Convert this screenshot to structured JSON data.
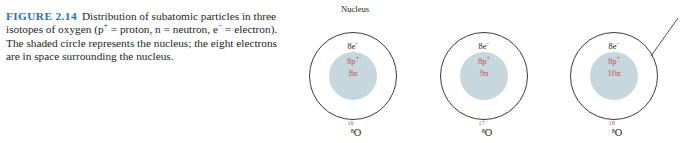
{
  "figure": {
    "label": "FIGURE 2.14",
    "caption": "Distribution of subatomic particles in three isotopes of oxygen (p",
    "caption_sup1": "+",
    "caption_part2": " = proton, n = neutron, e",
    "caption_sup2": "−",
    "caption_part3": " = electron). The shaded circle represents the nucleus; the eight electrons are in space surrounding the nucleus.",
    "label_color": "#2a70b8",
    "text_color": "#231f20"
  },
  "callout": {
    "nucleus_label": "Nucleus"
  },
  "diagram": {
    "nucleus_fill": "#c6d8dd",
    "nucleus_text_color": "#c2524b",
    "shell_stroke": "#3b3b3b",
    "atoms": [
      {
        "electrons": "8e−",
        "electrons_text": "8e",
        "electrons_sup": "−",
        "protons": "8p",
        "protons_sup": "+",
        "neutrons": "8n",
        "mass_number": "16",
        "atomic_number": "8",
        "symbol": "O"
      },
      {
        "electrons": "8e−",
        "electrons_text": "8e",
        "electrons_sup": "−",
        "protons": "8p",
        "protons_sup": "+",
        "neutrons": "9n",
        "mass_number": "17",
        "atomic_number": "8",
        "symbol": "O"
      },
      {
        "electrons": "8e−",
        "electrons_text": "8e",
        "electrons_sup": "−",
        "protons": "8p",
        "protons_sup": "+",
        "neutrons": "10n",
        "mass_number": "18",
        "atomic_number": "8",
        "symbol": "O"
      }
    ]
  }
}
